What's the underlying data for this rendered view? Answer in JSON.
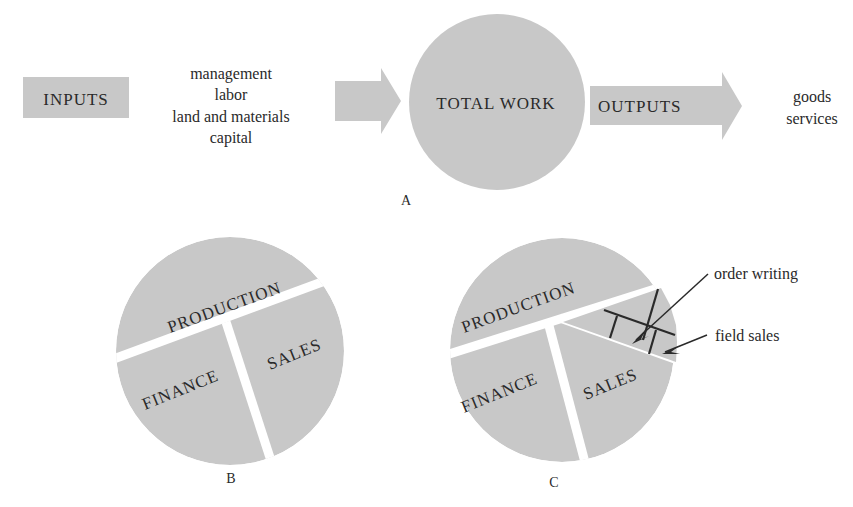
{
  "diagram_a": {
    "caption": "A",
    "inputs_label": "INPUTS",
    "input_items": [
      "management",
      "labor",
      "land and materials",
      "capital"
    ],
    "center_label": "TOTAL WORK",
    "outputs_label": "OUTPUTS",
    "output_items": [
      "goods",
      "services"
    ]
  },
  "diagram_b": {
    "caption": "B",
    "segments": [
      "PRODUCTION",
      "FINANCE",
      "SALES"
    ]
  },
  "diagram_c": {
    "caption": "C",
    "segments": [
      "PRODUCTION",
      "FINANCE",
      "SALES"
    ],
    "annotations": [
      "order writing",
      "field sales"
    ]
  },
  "colors": {
    "fill": "#c8c8c8",
    "text": "#2a2a2a",
    "background": "#ffffff"
  }
}
